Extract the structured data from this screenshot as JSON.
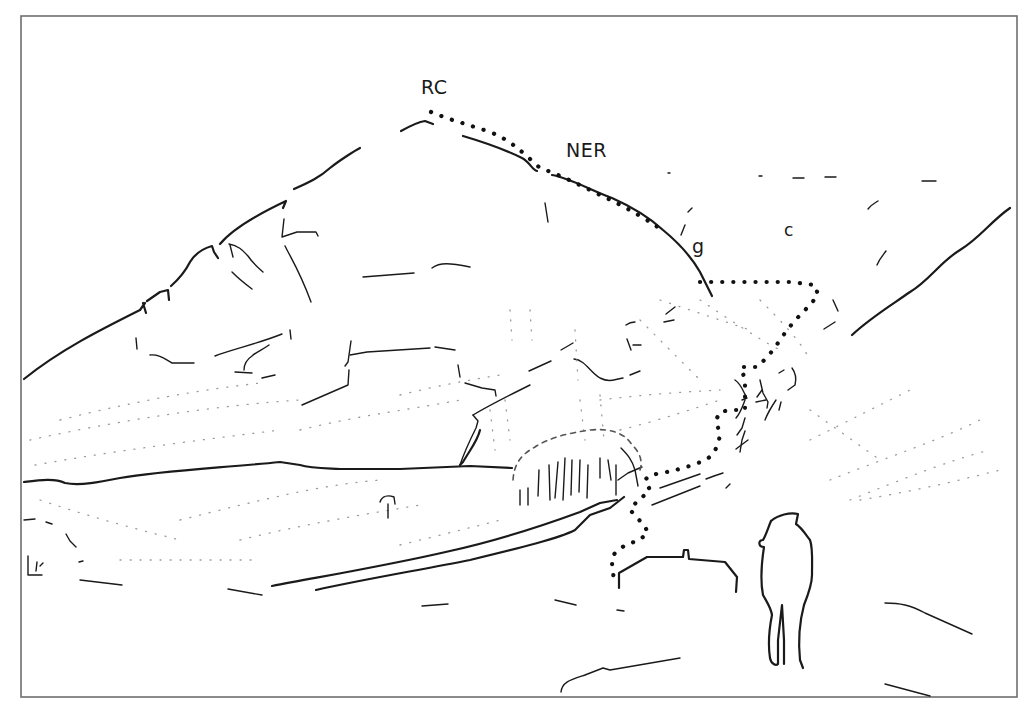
{
  "figure": {
    "type": "field sketch (line drawing) of a mountain slope with a dotted route line and a standing figure",
    "labels": {
      "rc": "RC",
      "ner": "NER",
      "g": "g",
      "c": "c"
    },
    "colors": {
      "ink": "#1a1a1a",
      "frame": "#6e6e6e",
      "background": "#ffffff"
    }
  }
}
